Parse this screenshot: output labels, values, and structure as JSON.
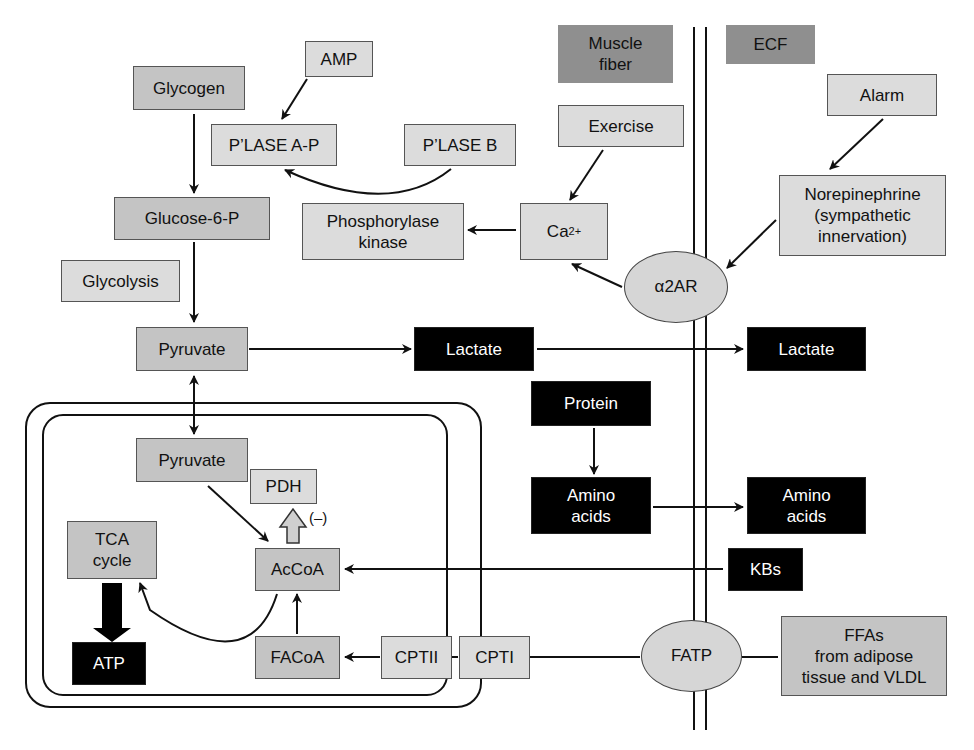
{
  "compartments": {
    "muscle_fiber": "Muscle\nfiber",
    "ecf": "ECF"
  },
  "nodes": {
    "amp": "AMP",
    "glycogen": "Glycogen",
    "plase_ap": "P’LASE A-P",
    "plase_b": "P’LASE B",
    "exercise": "Exercise",
    "alarm": "Alarm",
    "glucose6p": "Glucose-6-P",
    "phosphorylase_kinase": "Phosphorylase\nkinase",
    "calcium": "Ca",
    "calcium_charge": "2+",
    "norepinephrine": "Norepinephrine\n(sympathetic\ninnervation)",
    "glycolysis": "Glycolysis",
    "a2ar": "α2AR",
    "pyruvate_cytosol": "Pyruvate",
    "lactate_cell": "Lactate",
    "lactate_ecf": "Lactate",
    "protein": "Protein",
    "pyruvate_mito": "Pyruvate",
    "pdh": "PDH",
    "pdh_inhibition": "(–)",
    "amino_acids_cell": "Amino\nacids",
    "amino_acids_ecf": "Amino\nacids",
    "tca_cycle": "TCA\ncycle",
    "accoa": "AcCoA",
    "kbs": "KBs",
    "atp": "ATP",
    "facoa": "FACoA",
    "cptii": "CPTII",
    "cpti": "CPTI",
    "fatp": "FATP",
    "ffas": "FFAs\nfrom adipose\ntissue and VLDL"
  },
  "colors": {
    "light_box": "#dcdcdc",
    "mid_box": "#c4c4c4",
    "compartment_label": "#8f8f8f",
    "black_box": "#000000"
  }
}
